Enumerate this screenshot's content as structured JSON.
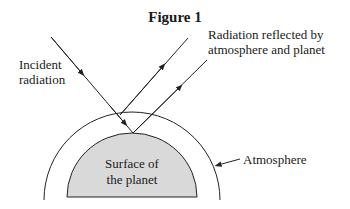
{
  "figure": {
    "title": "Figure 1",
    "labels": {
      "incident_line1": "Incident",
      "incident_line2": "radiation",
      "reflected_line1": "Radiation reflected by",
      "reflected_line2": "atmosphere and planet",
      "atmosphere": "Atmosphere",
      "surface_line1": "Surface of",
      "surface_line2": "the planet"
    },
    "colors": {
      "planet_fill": "#d9d9d9",
      "stroke": "#222222"
    }
  }
}
